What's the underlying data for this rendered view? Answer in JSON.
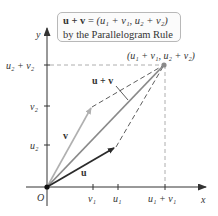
{
  "caption": {
    "line1_lhs": "u + v",
    "line1_eq": " = ",
    "line1_rhs": "(u₁ + v₁, u₂ + v₂)",
    "line2": "by the Parallelogram Rule"
  },
  "axes": {
    "x_label": "x",
    "y_label": "y",
    "origin_label": "O",
    "x_ticks": [
      "v₁",
      "u₁",
      "u₁ + v₁"
    ],
    "y_ticks": [
      "u₂",
      "v₂",
      "u₂ + v₂"
    ]
  },
  "vectors": {
    "u_label": "u",
    "v_label": "v",
    "sum_label": "u + v",
    "sum_point_label": "(u₁ + v₁, u₂ + v₂)"
  },
  "colors": {
    "u": "#2b2b2b",
    "v": "#b0b0b0",
    "sum": "#8a8a8a",
    "dash": "#555555"
  }
}
